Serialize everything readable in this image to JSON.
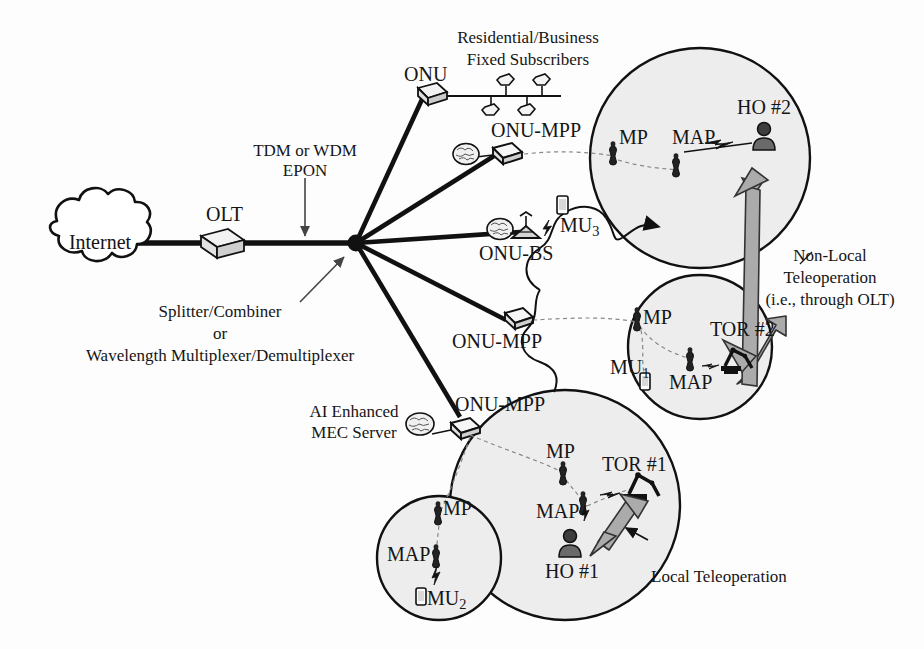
{
  "figure": {
    "background_color": "#fdfdfd",
    "line_color": "#111111",
    "cell_fill": "#eeeeee",
    "arrow_fill": "#a8a8a8"
  },
  "nodes": {
    "internet": {
      "label": "Internet",
      "type": "cloud"
    },
    "olt": {
      "label": "OLT",
      "type": "box3d"
    },
    "splitter": {
      "label": "",
      "type": "junction"
    },
    "onu": {
      "label": "ONU",
      "type": "box3d-small"
    },
    "onu_mpp_1": {
      "label": "ONU-MPP",
      "type": "diamond"
    },
    "onu_bs": {
      "label": "ONU-BS",
      "type": "basestation"
    },
    "onu_mpp_2": {
      "label": "ONU-MPP",
      "type": "diamond"
    },
    "onu_mpp_3": {
      "label": "ONU-MPP",
      "type": "diamond"
    }
  },
  "annotations": {
    "epon": "TDM or WDM\nEPON",
    "epon_line1": "TDM or WDM",
    "epon_line2": "EPON",
    "splitter_line1": "Splitter/Combiner",
    "splitter_line2": "or",
    "splitter_line3": "Wavelength Multiplexer/Demultiplexer",
    "subscribers_line1": "Residential/Business",
    "subscribers_line2": "Fixed Subscribers",
    "mec_line1": "AI Enhanced",
    "mec_line2": "MEC Server",
    "nonlocal_line1": "Non-Local",
    "nonlocal_line2": "Teleoperation",
    "nonlocal_line3": "(i.e., through OLT)",
    "local_teleop": "Local Teleoperation"
  },
  "cells": [
    {
      "id": "cell-ho2",
      "cx": 700,
      "cy": 158,
      "r": 110,
      "elements": [
        {
          "name": "mp",
          "label": "MP",
          "x": 614,
          "y": 152,
          "type": "antenna"
        },
        {
          "name": "map",
          "label": "MAP",
          "x": 676,
          "y": 164,
          "type": "antenna"
        },
        {
          "name": "ho2",
          "label": "HO #2",
          "x": 762,
          "y": 138,
          "type": "human"
        }
      ]
    },
    {
      "id": "cell-tor2",
      "cx": 700,
      "cy": 347,
      "r": 72,
      "elements": [
        {
          "name": "mp",
          "label": "MP",
          "x": 637,
          "y": 318,
          "type": "antenna"
        },
        {
          "name": "mu1",
          "label": "MU",
          "sub": "1",
          "x": 644,
          "y": 372,
          "type": "phone"
        },
        {
          "name": "map",
          "label": "MAP",
          "x": 690,
          "y": 357,
          "type": "antenna"
        },
        {
          "name": "tor2",
          "label": "TOR #2",
          "x": 733,
          "y": 345,
          "type": "robot"
        }
      ]
    },
    {
      "id": "cell-ho1",
      "cx": 565,
      "cy": 505,
      "r": 115,
      "elements": [
        {
          "name": "mp",
          "label": "MP",
          "x": 563,
          "y": 470,
          "type": "antenna"
        },
        {
          "name": "map",
          "label": "MAP",
          "x": 583,
          "y": 502,
          "type": "antenna"
        },
        {
          "name": "ho1",
          "label": "HO #1",
          "x": 570,
          "y": 562,
          "type": "human"
        },
        {
          "name": "tor1",
          "label": "TOR #1",
          "x": 638,
          "y": 488,
          "type": "robot"
        }
      ]
    },
    {
      "id": "cell-mu2",
      "cx": 439,
      "cy": 558,
      "r": 62,
      "elements": [
        {
          "name": "mp",
          "label": "MP",
          "x": 438,
          "y": 512,
          "type": "antenna"
        },
        {
          "name": "map",
          "label": "MAP",
          "x": 436,
          "y": 555,
          "type": "antenna"
        },
        {
          "name": "mu2",
          "label": "MU",
          "sub": "2",
          "x": 424,
          "y": 597,
          "type": "phone"
        }
      ]
    }
  ],
  "mobile_users": [
    {
      "name": "mu3",
      "label": "MU",
      "sub": "3",
      "x": 555,
      "y": 208,
      "type": "phone"
    }
  ],
  "subscribers": {
    "count": 4,
    "bus_label": ""
  },
  "labels": {
    "internet": "Internet",
    "olt": "OLT",
    "onu": "ONU",
    "onu_mpp": "ONU-MPP",
    "onu_bs": "ONU-BS",
    "mp": "MP",
    "map": "MAP",
    "ho1": "HO #1",
    "ho2": "HO #2",
    "tor1": "TOR #1",
    "tor2": "TOR #2",
    "mu": "MU",
    "mu1_sub": "1",
    "mu2_sub": "2",
    "mu3_sub": "3"
  }
}
